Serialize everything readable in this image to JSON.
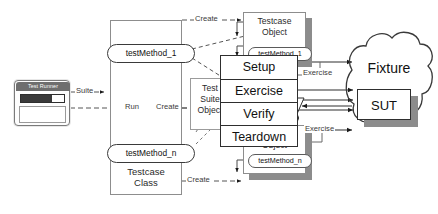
{
  "diagram": {
    "colors": {
      "stroke": "#2e2e2e",
      "light_stroke": "#8d8d8d",
      "shadow": "#8c8c8c",
      "titlebar": "#6e6e6e",
      "progress_fill": "#3a3a3a",
      "background": "#ffffff"
    }
  },
  "test_runner": {
    "title": "Test Runner",
    "progress_percent": 72,
    "panel_text": ""
  },
  "testcase_class": {
    "label_line1": "Testcase",
    "label_line2": "Class",
    "methods": [
      {
        "label": "testMethod_1"
      },
      {
        "label": "testMethod_n"
      }
    ]
  },
  "test_suite_object": {
    "label_line1": "Test",
    "label_line2": "Suite",
    "label_line3": "Object"
  },
  "testcase_objects": [
    {
      "label_line1": "Testcase",
      "label_line2": "Object",
      "method": "testMethod_1"
    },
    {
      "label_line1": "Testcase",
      "label_line2": "Object",
      "method": "testMethod_n"
    }
  ],
  "phase_box": {
    "phases": [
      {
        "label": "Setup"
      },
      {
        "label": "Exercise"
      },
      {
        "label": "Verify"
      },
      {
        "label": "Teardown"
      }
    ]
  },
  "fixture": {
    "label": "Fixture",
    "sut_label": "SUT"
  },
  "edges": {
    "suite": "Suite",
    "run": "Run",
    "create_top": "Create",
    "create_mid": "Create",
    "create_bottom": "Create",
    "exercise_top": "Exercise",
    "exercise_bottom": "Exercise"
  }
}
